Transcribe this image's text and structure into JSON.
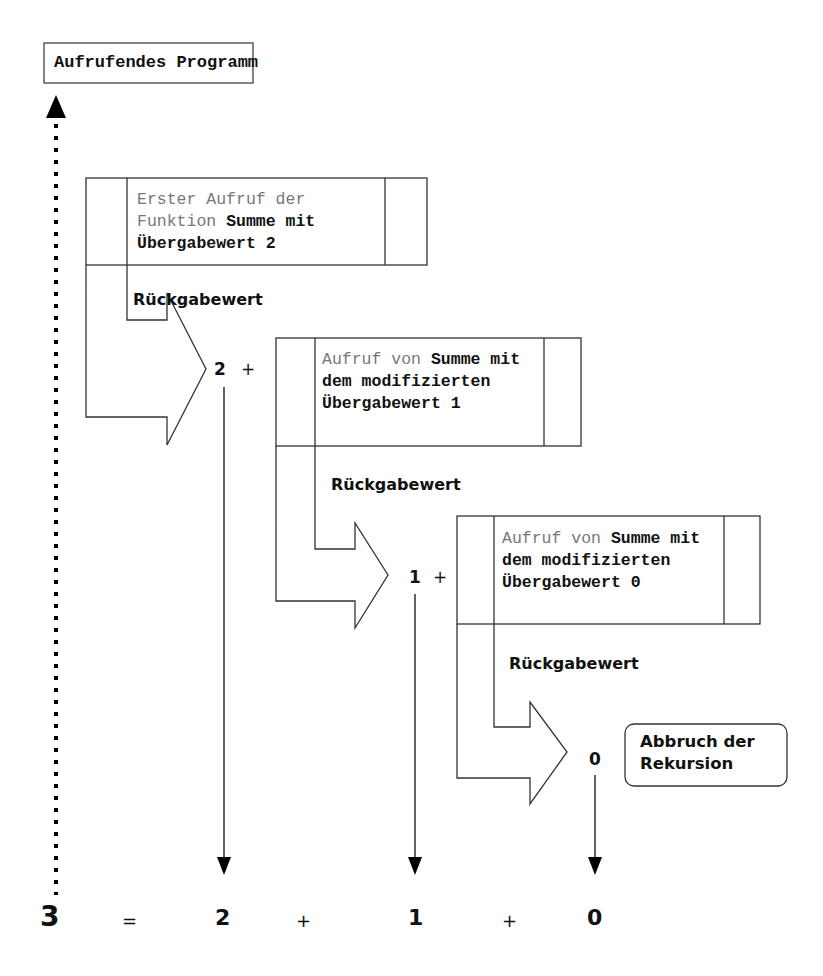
{
  "caller": {
    "label": "Aufrufendes Programm"
  },
  "calls": [
    {
      "text_light": "Erster Aufruf der Funktion ",
      "text_bold": "Summe mit Übergabewert 2",
      "return_label": "Rückgabewert",
      "value": "2",
      "op": "+"
    },
    {
      "text_light": "Aufruf von ",
      "text_bold": "Summe mit dem modifizierten Übergabewert 1",
      "return_label": "Rückgabewert",
      "value": "1",
      "op": "+"
    },
    {
      "text_light": "Aufruf von ",
      "text_bold": "Summe mit dem modifizierten Übergabewert 0",
      "return_label": "Rückgabewert",
      "value": "0"
    }
  ],
  "termination": {
    "label": "Abbruch der Rekursion"
  },
  "equation": {
    "result": "3",
    "equals": "=",
    "terms": [
      "2",
      "1",
      "0"
    ],
    "ops": [
      "+",
      "+"
    ]
  }
}
